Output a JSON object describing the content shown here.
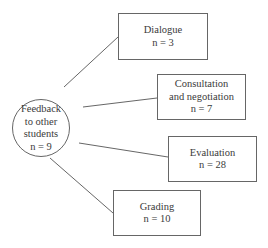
{
  "hub": {
    "line1": "Feedback",
    "line2": "to other",
    "line3": "students",
    "count": "n = 9"
  },
  "nodes": [
    {
      "label": "Dialogue",
      "label2": "",
      "count": "n = 3"
    },
    {
      "label": "Consultation",
      "label2": "and negotiation",
      "count": "n = 7"
    },
    {
      "label": "Evaluation",
      "label2": "",
      "count": "n = 28"
    },
    {
      "label": "Grading",
      "label2": "",
      "count": "n = 10"
    }
  ]
}
